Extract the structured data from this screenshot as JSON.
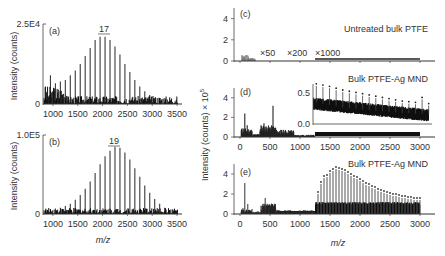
{
  "chart_data": [
    {
      "panel": "(a)",
      "type": "bar",
      "title": "",
      "xlabel": "",
      "ylabel": "Intensity (counts)",
      "ytick_labels": [
        "2.5E4",
        "0"
      ],
      "ylim": [
        0,
        25000
      ],
      "xlim": [
        800,
        3600
      ],
      "xticks": [
        1000,
        1500,
        2000,
        2500,
        3000,
        3500
      ],
      "annotation": "17",
      "annotation_x": 2000,
      "x": [
        850,
        950,
        1050,
        1150,
        1250,
        1350,
        1450,
        1550,
        1650,
        1750,
        1850,
        1950,
        2050,
        2150,
        2250,
        2350,
        2450,
        2550,
        2650,
        2750,
        2850,
        2950,
        3050,
        3150,
        3250,
        3350,
        3450
      ],
      "values": [
        5500,
        9000,
        6500,
        7000,
        7500,
        9000,
        10500,
        12500,
        15000,
        17500,
        20000,
        21000,
        21000,
        20000,
        18000,
        15500,
        12500,
        10000,
        7500,
        5500,
        4000,
        2800,
        1900,
        1200,
        800,
        500,
        300
      ]
    },
    {
      "panel": "(b)",
      "type": "bar",
      "title": "",
      "xlabel": "m/z",
      "ylabel": "Intensity (counts)",
      "ytick_labels": [
        "1.0E5",
        "0"
      ],
      "ylim": [
        0,
        100000
      ],
      "xlim": [
        800,
        3600
      ],
      "xticks": [
        1000,
        1500,
        2000,
        2500,
        3000,
        3500
      ],
      "annotation": "19",
      "annotation_x": 2250,
      "x": [
        850,
        950,
        1050,
        1150,
        1250,
        1350,
        1450,
        1550,
        1650,
        1750,
        1850,
        1950,
        2050,
        2150,
        2250,
        2350,
        2450,
        2550,
        2650,
        2750,
        2850,
        2950,
        3050,
        3150,
        3250,
        3350,
        3450
      ],
      "values": [
        5000,
        6000,
        7000,
        8000,
        10000,
        13000,
        18000,
        24000,
        32000,
        41000,
        52000,
        63000,
        73000,
        80000,
        85000,
        84000,
        78000,
        69000,
        58000,
        47000,
        36000,
        27000,
        19000,
        13000,
        8000,
        5000,
        3000
      ]
    },
    {
      "panel": "(c)",
      "type": "line",
      "title": "Untreated bulk PTFE",
      "ylabel": "Intensity (counts) × 10^5",
      "ylim": [
        0,
        5
      ],
      "yticks": [
        0,
        2,
        4
      ],
      "xlim": [
        -100,
        3200
      ],
      "annotations": [
        "×50",
        "×200",
        "×1000"
      ],
      "annotation_x": [
        400,
        800,
        1250
      ],
      "x": [
        50,
        100,
        150,
        200,
        300,
        500,
        1000,
        1500,
        2000,
        2500,
        3000
      ],
      "values": [
        0.3,
        0.6,
        0.4,
        0.2,
        0.1,
        0.05,
        0.05,
        0.2,
        0.2,
        0.2,
        0.2
      ]
    },
    {
      "panel": "(d)",
      "type": "bar",
      "title": "Bulk PTFE-Ag MND",
      "ylim": [
        0,
        5
      ],
      "yticks": [
        0,
        2,
        4
      ],
      "xlim": [
        -100,
        3200
      ],
      "xticks": [
        0,
        500,
        1000,
        1500,
        2000,
        2500,
        3000
      ],
      "x": [
        50,
        80,
        120,
        200,
        300,
        350,
        400,
        450,
        500,
        550,
        650,
        800,
        1000,
        1500,
        2000,
        2500,
        3000
      ],
      "values": [
        0.9,
        2.4,
        1.2,
        0.6,
        0.3,
        1.2,
        1.4,
        0.9,
        1.0,
        3.2,
        0.5,
        0.4,
        0.15,
        0.5,
        0.4,
        0.35,
        0.3
      ],
      "inset": {
        "ylim": [
          0,
          0.6
        ],
        "yticks": [
          0.0,
          0.5
        ],
        "xlim": [
          1250,
          3000
        ],
        "x": [
          1300,
          1400,
          1500,
          1600,
          1700,
          1800,
          1900,
          2000,
          2100,
          2200,
          2300,
          2400,
          2500,
          2600,
          2700,
          2800,
          2900,
          3000
        ],
        "baseline": [
          0.35,
          0.33,
          0.31,
          0.29,
          0.27,
          0.26,
          0.25,
          0.24,
          0.23,
          0.22,
          0.21,
          0.2,
          0.19,
          0.18,
          0.18,
          0.17,
          0.17,
          0.16
        ],
        "peaks": [
          0.62,
          0.6,
          0.58,
          0.55,
          0.52,
          0.5,
          0.48,
          0.46,
          0.44,
          0.42,
          0.4,
          0.38,
          0.36,
          0.34,
          0.33,
          0.32,
          0.4,
          0.3
        ]
      }
    },
    {
      "panel": "(e)",
      "type": "bar",
      "title": "Bulk PTFE-Ag MND",
      "xlabel": "m/z",
      "ylim": [
        0,
        5
      ],
      "yticks": [
        0,
        2,
        4
      ],
      "xlim": [
        -100,
        3200
      ],
      "xticks": [
        0,
        500,
        1000,
        1500,
        2000,
        2500,
        3000
      ],
      "x": [
        50,
        80,
        130,
        200,
        300,
        380,
        420,
        480,
        600,
        800,
        1000,
        1200,
        1300,
        1350,
        1400,
        1450,
        1500,
        1550,
        1600,
        1650,
        1700,
        1750,
        1800,
        1850,
        1900,
        1950,
        2000,
        2050,
        2100,
        2150,
        2200,
        2250,
        2300,
        2350,
        2400,
        2450,
        2500,
        2550,
        2600,
        2650,
        2700,
        2750,
        2800,
        2850,
        2900,
        2950,
        3000
      ],
      "values": [
        0.6,
        3.1,
        1.0,
        0.5,
        0.3,
        1.0,
        1.6,
        0.6,
        0.3,
        0.25,
        0.25,
        0.25,
        2.0,
        3.0,
        3.6,
        3.7,
        4.1,
        4.3,
        4.5,
        4.4,
        4.3,
        4.2,
        4.0,
        3.8,
        3.6,
        3.5,
        3.3,
        3.1,
        2.9,
        2.8,
        2.6,
        2.5,
        2.3,
        2.2,
        2.1,
        2.0,
        1.9,
        1.8,
        1.8,
        1.7,
        1.6,
        1.6,
        1.5,
        1.5,
        1.4,
        1.4,
        1.4
      ]
    }
  ],
  "labels": {
    "a_panel": "(a)",
    "b_panel": "(b)",
    "c_panel": "(c)",
    "d_panel": "(d)",
    "e_panel": "(e)",
    "a_ytop": "2.5E4",
    "a_y0": "0",
    "b_ytop": "1.0E5",
    "b_y0": "0",
    "a_peak": "17",
    "b_peak": "19",
    "left_ylabel": "Intensity (counts)",
    "right_ylabel": "Intensity (counts) × 10",
    "right_ylabel_exp": "5",
    "xlabel": "m/z",
    "c_title": "Untreated bulk PTFE",
    "d_title": "Bulk PTFE-Ag MND",
    "e_title": "Bulk PTFE-Ag MND",
    "c_x50": "×50",
    "c_x200": "×200",
    "c_x1000": "×1000",
    "inset_ytop": "0.5",
    "inset_y0": "0.0",
    "left_xticks": [
      "1000",
      "1500",
      "2000",
      "2500",
      "3000",
      "3500"
    ],
    "right_xticks": [
      "0",
      "500",
      "1000",
      "1500",
      "2000",
      "2500",
      "3000"
    ],
    "right_yticks": [
      "4",
      "2",
      "0"
    ]
  }
}
